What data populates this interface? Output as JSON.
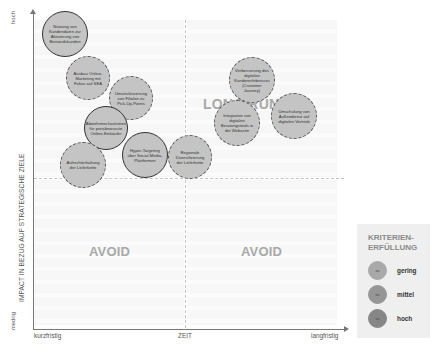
{
  "axes": {
    "y_title": "IMPACT IN BEZUG AUF STRATEGISCHE ZIELE",
    "y_high": "hoch",
    "y_low": "niedrig",
    "x_title": "ZEIT",
    "x_low": "kurzfristig",
    "x_high": "langfristig"
  },
  "quadrants": {
    "top_right": "LONG RUN",
    "bottom_left": "AVOID",
    "bottom_right": "AVOID"
  },
  "bubbles": [
    {
      "label": "Nutzung von Kundendaten zur Aktivierung von Bestandskunden",
      "x": 65,
      "y": 34,
      "d": 46,
      "style": "solid"
    },
    {
      "label": "Ausbau Online-Marketing mit Fokus auf SEA",
      "x": 88,
      "y": 78,
      "d": 44,
      "style": "dashed"
    },
    {
      "label": "Umstrukturierung von Filialen zu Pick-Up-Points",
      "x": 131,
      "y": 98,
      "d": 44,
      "style": "dashed"
    },
    {
      "label": "Abwehrmechanismen für preisbewusste Online-Einkäufer",
      "x": 106,
      "y": 128,
      "d": 44,
      "style": "solid"
    },
    {
      "label": "Hyper-Targeting über Social-Media-Plattformen",
      "x": 145,
      "y": 155,
      "d": 46,
      "style": "solid"
    },
    {
      "label": "Aufrechterhaltung der Lieferkette",
      "x": 83,
      "y": 165,
      "d": 46,
      "style": "dashed"
    },
    {
      "label": "Regionale Diversifizierung der Lieferkette",
      "x": 190,
      "y": 157,
      "d": 44,
      "style": "dashed"
    },
    {
      "label": "Verbesserung des digitalen Kundenerlebnisses (Customer Journey)",
      "x": 252,
      "y": 80,
      "d": 46,
      "style": "dashed"
    },
    {
      "label": "Integration von digitalen Beratungstools in die Webseite",
      "x": 237,
      "y": 123,
      "d": 46,
      "style": "dashed"
    },
    {
      "label": "Umschulung von Außendienst auf digitalen Vertrieb",
      "x": 294,
      "y": 116,
      "d": 46,
      "style": "dashed"
    }
  ],
  "legend": {
    "title_line1": "KRITERIEN-",
    "title_line2": "ERFÜLLUNG",
    "items": [
      {
        "label": "gering",
        "marker": "xx",
        "color": "#a9a9a9"
      },
      {
        "label": "mittel",
        "marker": "xx",
        "color": "#969696"
      },
      {
        "label": "hoch",
        "marker": "xx",
        "color": "#868686"
      }
    ]
  },
  "colors": {
    "bubble_fill": "#c4c4c4",
    "quadrant_label": "#a9a9a9",
    "axis": "#777777"
  }
}
